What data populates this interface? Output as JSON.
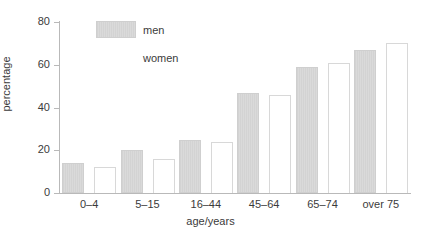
{
  "chart_data": {
    "type": "bar",
    "title": "",
    "xlabel": "age/years",
    "ylabel": "percentage",
    "categories": [
      "0–4",
      "5–15",
      "16–44",
      "45–64",
      "65–74",
      "over 75"
    ],
    "series": [
      {
        "name": "men",
        "values": [
          14,
          20,
          25,
          47,
          59,
          67
        ]
      },
      {
        "name": "women",
        "values": [
          12,
          16,
          24,
          46,
          61,
          70
        ]
      }
    ],
    "ylim": [
      0,
      80
    ],
    "yticks": [
      0,
      20,
      40,
      60,
      80
    ],
    "ytick_labels": [
      "0",
      "20",
      "40",
      "60",
      "80"
    ],
    "grid": false,
    "legend_position": "top-left-inside",
    "colors": {
      "men_fill": "#d6d6d6",
      "men_edge": "#cfcfcf",
      "women_fill": "#ffffff",
      "women_edge": "#d8d8d8",
      "axis": "#b9b9b9",
      "text": "#3b3b3b",
      "background": "#ffffff"
    }
  },
  "legend": {
    "entries": [
      {
        "label": "men"
      },
      {
        "label": "women"
      }
    ]
  }
}
